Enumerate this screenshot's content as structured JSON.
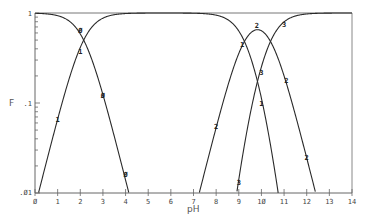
{
  "chart_data": {
    "type": "line",
    "title": "",
    "xlabel": "pH",
    "ylabel": "F",
    "xlim": [
      0,
      14
    ],
    "ylim": [
      0.01,
      1
    ],
    "yscale": "log",
    "grid": false,
    "legend": "inline markers on curves",
    "x_ticks": [
      "0",
      "1",
      "2",
      "3",
      "4",
      "5",
      "6",
      "7",
      "8",
      "9",
      "10",
      "11",
      "12",
      "13",
      "14"
    ],
    "y_ticks": [
      "1",
      ".1",
      ".01"
    ],
    "pKa": [
      2.15,
      9.25,
      10.4
    ],
    "series": [
      {
        "name": "0",
        "marker": "0",
        "x": [
          0,
          1,
          2,
          2.15,
          3,
          4,
          4.2
        ],
        "values": [
          0.99,
          0.93,
          0.59,
          0.5,
          0.12,
          0.014,
          0.01
        ]
      },
      {
        "name": "1",
        "marker": "1",
        "x": [
          0.2,
          1,
          2,
          2.15,
          3,
          5,
          7,
          9,
          9.25,
          9.5,
          10,
          10.6
        ],
        "values": [
          0.01,
          0.066,
          0.41,
          0.5,
          0.87,
          0.99,
          0.99,
          0.58,
          0.44,
          0.32,
          0.1,
          0.01
        ]
      },
      {
        "name": "2",
        "marker": "2",
        "x": [
          7,
          8,
          9,
          9.25,
          9.8,
          10.4,
          11,
          12,
          12.5
        ],
        "values": [
          0.01,
          0.055,
          0.35,
          0.45,
          0.72,
          0.46,
          0.2,
          0.025,
          0.01
        ]
      },
      {
        "name": "3",
        "marker": "3",
        "x": [
          8.9,
          9,
          10,
          10.4,
          11,
          12,
          13,
          14
        ],
        "values": [
          0.01,
          0.012,
          0.25,
          0.46,
          0.78,
          0.97,
          1.0,
          1.0
        ]
      }
    ],
    "marker_positions": [
      {
        "label": "0",
        "x": 2.0,
        "y": 0.64
      },
      {
        "label": "0",
        "x": 3.0,
        "y": 0.12
      },
      {
        "label": "0",
        "x": 4.0,
        "y": 0.016
      },
      {
        "label": "1",
        "x": 1.0,
        "y": 0.066
      },
      {
        "label": "1",
        "x": 2.0,
        "y": 0.37
      },
      {
        "label": "1",
        "x": 9.15,
        "y": 0.45
      },
      {
        "label": "1",
        "x": 10.0,
        "y": 0.1
      },
      {
        "label": "2",
        "x": 8.0,
        "y": 0.055
      },
      {
        "label": "2",
        "x": 9.8,
        "y": 0.72
      },
      {
        "label": "2",
        "x": 11.1,
        "y": 0.18
      },
      {
        "label": "2",
        "x": 12.0,
        "y": 0.025
      },
      {
        "label": "3",
        "x": 9.0,
        "y": 0.013
      },
      {
        "label": "3",
        "x": 10.0,
        "y": 0.22
      },
      {
        "label": "3",
        "x": 11.0,
        "y": 0.75
      }
    ]
  },
  "labels": {
    "y_axis": "F",
    "x_axis": "pH"
  }
}
